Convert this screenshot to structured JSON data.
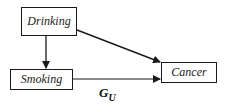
{
  "diagram": {
    "type": "causal-dag",
    "nodes": [
      {
        "id": "drinking",
        "label": "Drinking"
      },
      {
        "id": "smoking",
        "label": "Smoking"
      },
      {
        "id": "cancer",
        "label": "Cancer"
      }
    ],
    "edges": [
      {
        "from": "drinking",
        "to": "smoking"
      },
      {
        "from": "drinking",
        "to": "cancer"
      },
      {
        "from": "smoking",
        "to": "cancer"
      }
    ],
    "graph_label": {
      "main": "G",
      "subscript": "U"
    },
    "colors": {
      "stroke": "#1a1a1a",
      "background": "#ffffff",
      "text": "#222222"
    }
  }
}
